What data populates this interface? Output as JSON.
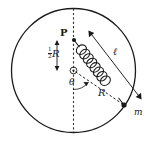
{
  "figure": {
    "type": "physics-diagram",
    "colors": {
      "stroke": "#1a1a1a",
      "background": "#ffffff",
      "dashed": "#555555"
    },
    "circle": {
      "center_x": 73.5,
      "center_y": 70.5,
      "radius": 62
    },
    "points": {
      "attachment_P": {
        "x": 74,
        "y": 40,
        "label": "P"
      },
      "center_O": {
        "x": 73.5,
        "y": 70.5
      },
      "mass_m": {
        "x": 124,
        "y": 105,
        "label": "m"
      }
    },
    "labels": {
      "point_p": "P",
      "half_r_numerator": "1",
      "half_r_denominator": "2",
      "half_r_symbol": "R",
      "angle_theta": "θ",
      "radius_r": "R",
      "spring_length": "ℓ",
      "mass": "m"
    },
    "annotations": {
      "vertical_diameter": "dashed vertical diameter line",
      "half_r_measure": "double-headed arrow measuring R/2 from P down to center",
      "theta_arc": "angle theta between downward vertical and radius to mass",
      "radius_dashed": "dashed radius R from center to mass m",
      "spring": "helical coil spring from P to mass m",
      "ell_measure": "double-headed arrow measuring spring length ℓ",
      "spring_coils": 8
    }
  }
}
